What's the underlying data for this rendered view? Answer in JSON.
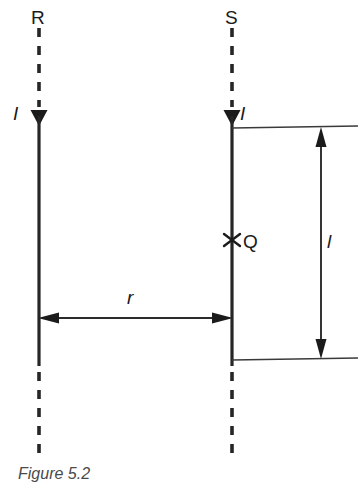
{
  "figure": {
    "caption": "Figure 5.2",
    "labels": {
      "conductor_left": "R",
      "conductor_right": "S",
      "current_left": "I",
      "current_right": "I",
      "charge_point": "Q",
      "separation": "r",
      "length": "l"
    },
    "colors": {
      "ink": "#1b1b1b",
      "line": "#262626",
      "background": "#ffffff",
      "caption": "#4a4a4a"
    },
    "elements": {
      "conductor_left_name": "conductor-R",
      "conductor_right_name": "conductor-S",
      "charge_marker_glyph": "cross-marker",
      "separation_arrow": "double-headed-horizontal-arrow",
      "length_arrow": "double-headed-vertical-arrow",
      "current_arrow_left": "downward-arrowhead",
      "current_arrow_right": "downward-arrowhead"
    }
  }
}
